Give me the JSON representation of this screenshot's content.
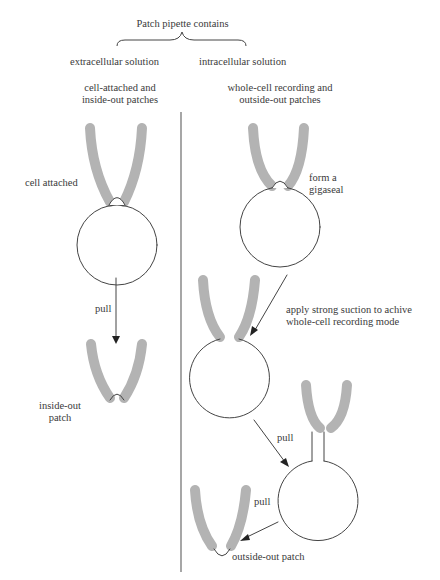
{
  "header": {
    "title": "Patch pipette contains",
    "left_solution": "extracellular solution",
    "right_solution": "intracellular solution"
  },
  "columns": {
    "left": {
      "line1": "cell-attached and",
      "line2": "inside-out patches"
    },
    "right": {
      "line1": "whole-cell recording and",
      "line2": "outside-out patches"
    }
  },
  "labels": {
    "cell_attached": "cell attached",
    "pull_left": "pull",
    "inside_out_line1": "inside-out",
    "inside_out_line2": "patch",
    "gigaseal_line1": "form a",
    "gigaseal_line2": "gigaseal",
    "suction_line1": "apply strong suction to achive",
    "suction_line2": "whole-cell recording mode",
    "pull_mid": "pull",
    "pull_bottom": "pull",
    "outside_out": "outside-out patch"
  },
  "colors": {
    "pipette": "#b3b3b3",
    "line": "#444444",
    "text": "#3a3a3a"
  }
}
